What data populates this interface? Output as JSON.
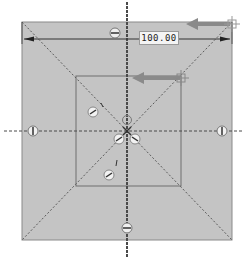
{
  "viewport": {
    "background": "#ffffff"
  },
  "sketch": {
    "fill_color": "#c4c4c4",
    "line_color": "#7a7a7a",
    "centerline_color": "#4a4a4a",
    "highlight_arrow_color": "#8c8c8c",
    "outer_square": {
      "x1": 22,
      "y1": 22,
      "x2": 232,
      "y2": 240
    },
    "inner_square": {
      "x1": 76,
      "y1": 76,
      "x2": 181,
      "y2": 186
    },
    "origin": {
      "x": 127,
      "y": 130
    }
  },
  "dimension": {
    "value": "100.00",
    "units_hidden": true
  },
  "constraints": {
    "symmetric_top": "symmetric-icon",
    "symmetric_bottom": "symmetric-icon",
    "vertical_left": "vertical-icon",
    "vertical_right": "vertical-icon",
    "diagonal_markers": [
      "perpendicular-icon",
      "perpendicular-icon",
      "coincident-icon",
      "perpendicular-icon",
      "perpendicular-icon"
    ]
  },
  "arrows": [
    {
      "name": "drag-arrow-outer",
      "from": [
        232,
        24
      ],
      "to": [
        190,
        24
      ]
    },
    {
      "name": "drag-arrow-inner",
      "from": [
        181,
        78
      ],
      "to": [
        133,
        78
      ]
    }
  ]
}
